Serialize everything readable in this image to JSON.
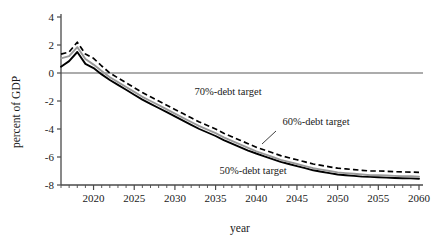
{
  "chart_data": {
    "type": "line",
    "title": "",
    "xlabel": "year",
    "ylabel": "percent of GDP",
    "xlim": [
      2016,
      2060
    ],
    "ylim": [
      -8,
      4
    ],
    "grid": false,
    "legend_position": "inline-annotations",
    "y_ticks": [
      "4",
      "2",
      "0",
      "-2",
      "-4",
      "-6",
      "-8"
    ],
    "y_tick_values": [
      4,
      2,
      0,
      -2,
      -4,
      -6,
      -8
    ],
    "x_ticks": [
      "2020",
      "2025",
      "2030",
      "2035",
      "2040",
      "2045",
      "2050",
      "2055",
      "2060"
    ],
    "x_tick_values": [
      2020,
      2025,
      2030,
      2035,
      2040,
      2045,
      2050,
      2055,
      2060
    ],
    "x_minor_tick_interval": 1,
    "zero_line": 0,
    "x": [
      2016,
      2017,
      2018,
      2019,
      2020,
      2021,
      2022,
      2023,
      2024,
      2025,
      2026,
      2027,
      2028,
      2029,
      2030,
      2031,
      2032,
      2033,
      2034,
      2035,
      2036,
      2037,
      2038,
      2039,
      2040,
      2041,
      2042,
      2043,
      2044,
      2045,
      2046,
      2047,
      2048,
      2049,
      2050,
      2051,
      2052,
      2053,
      2054,
      2055,
      2056,
      2057,
      2058,
      2059,
      2060
    ],
    "series": [
      {
        "name": "70%-debt target",
        "style": "dashed",
        "color": "#000000",
        "values": [
          1.35,
          1.5,
          2.2,
          1.35,
          1.05,
          0.5,
          0.0,
          -0.35,
          -0.7,
          -1.05,
          -1.4,
          -1.7,
          -2.0,
          -2.3,
          -2.6,
          -2.9,
          -3.2,
          -3.5,
          -3.75,
          -4.0,
          -4.3,
          -4.55,
          -4.8,
          -5.05,
          -5.3,
          -5.5,
          -5.7,
          -5.9,
          -6.05,
          -6.2,
          -6.35,
          -6.5,
          -6.6,
          -6.7,
          -6.8,
          -6.85,
          -6.9,
          -6.95,
          -7.0,
          -7.0,
          -7.02,
          -7.05,
          -7.07,
          -7.08,
          -7.1
        ]
      },
      {
        "name": "60%-debt target",
        "style": "solid",
        "color": "#9a9a9a",
        "values": [
          1.05,
          1.2,
          1.85,
          1.0,
          0.6,
          0.15,
          -0.3,
          -0.65,
          -1.0,
          -1.35,
          -1.7,
          -2.0,
          -2.3,
          -2.6,
          -2.9,
          -3.2,
          -3.5,
          -3.8,
          -4.05,
          -4.3,
          -4.6,
          -4.85,
          -5.1,
          -5.35,
          -5.6,
          -5.8,
          -6.0,
          -6.2,
          -6.35,
          -6.5,
          -6.65,
          -6.8,
          -6.9,
          -7.0,
          -7.1,
          -7.15,
          -7.2,
          -7.25,
          -7.3,
          -7.3,
          -7.32,
          -7.35,
          -7.37,
          -7.38,
          -7.4
        ]
      },
      {
        "name": "50%-debt target",
        "style": "solid",
        "color": "#000000",
        "values": [
          0.45,
          0.85,
          1.5,
          0.65,
          0.35,
          -0.1,
          -0.5,
          -0.85,
          -1.2,
          -1.55,
          -1.9,
          -2.2,
          -2.5,
          -2.8,
          -3.1,
          -3.4,
          -3.7,
          -4.0,
          -4.25,
          -4.5,
          -4.8,
          -5.05,
          -5.3,
          -5.55,
          -5.75,
          -5.95,
          -6.15,
          -6.35,
          -6.5,
          -6.65,
          -6.8,
          -6.95,
          -7.05,
          -7.15,
          -7.25,
          -7.3,
          -7.35,
          -7.4,
          -7.42,
          -7.45,
          -7.47,
          -7.5,
          -7.52,
          -7.53,
          -7.55
        ]
      }
    ],
    "annotations": [
      {
        "text": "70%-debt target",
        "x": 2030,
        "y": -2.3
      },
      {
        "text": "60%-debt target",
        "x": 2042,
        "y": -3.6
      },
      {
        "text": "50%-debt target",
        "x": 2033,
        "y": -6.9
      }
    ]
  }
}
